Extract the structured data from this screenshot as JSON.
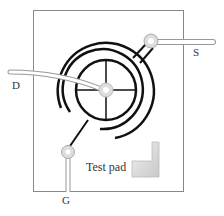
{
  "labels": {
    "drain": "D",
    "source": "S",
    "gate": "G",
    "test_pad": "Test pad"
  },
  "colors": {
    "outline": "#888888",
    "trace": "#111111",
    "wire": "#bbbbbb",
    "pad_fill": "#d8d8d8",
    "background": "#ffffff"
  }
}
